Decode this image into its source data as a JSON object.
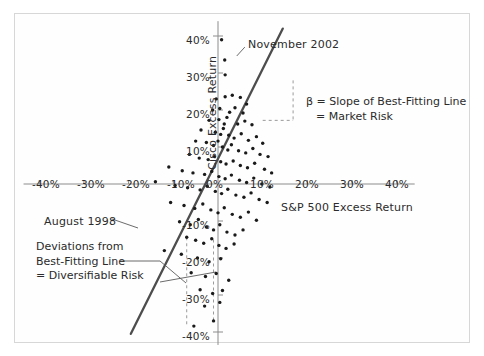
{
  "figure": {
    "background": "#ffffff",
    "frame_color": "#d7d7d7",
    "point_color": "#1a1a1a",
    "line_color": "#4d4d4d",
    "text_color": "#2b2b2b"
  },
  "chart_data": {
    "type": "scatter",
    "title": "",
    "xlabel": "S&P 500 Excess Return",
    "ylabel": "Cisco Excess Return",
    "xlim": [
      -45,
      45
    ],
    "ylim": [
      -45,
      45
    ],
    "grid": false,
    "legend": "none",
    "xticks": [
      "-40%",
      "-30%",
      "-20%",
      "-10%",
      "0%",
      "10%",
      "20%",
      "30%",
      "40%"
    ],
    "xtick_values": [
      -40,
      -30,
      -20,
      -10,
      0,
      10,
      20,
      30,
      40
    ],
    "yticks": [
      "40%",
      "30%",
      "20%",
      "10%",
      "0%",
      "-10%",
      "-20%",
      "-30%",
      "-40%"
    ],
    "ytick_values": [
      40,
      30,
      20,
      10,
      0,
      -10,
      -20,
      -30,
      -40
    ],
    "fit_line": {
      "x0": -19.5,
      "y0": -40.5,
      "x1": 14.5,
      "y1": 42.0,
      "label": "best-fitting-line"
    },
    "points": [
      [
        0.8,
        39.0
      ],
      [
        1.5,
        33.5
      ],
      [
        1.6,
        29.5
      ],
      [
        -0.4,
        23.0
      ],
      [
        1.6,
        23.6
      ],
      [
        3.2,
        24.0
      ],
      [
        5.0,
        23.4
      ],
      [
        6.4,
        21.6
      ],
      [
        -1.2,
        20.0
      ],
      [
        0.4,
        20.4
      ],
      [
        2.6,
        19.4
      ],
      [
        3.8,
        20.6
      ],
      [
        5.6,
        19.2
      ],
      [
        -2.0,
        17.2
      ],
      [
        0.2,
        17.4
      ],
      [
        1.4,
        16.2
      ],
      [
        2.0,
        18.0
      ],
      [
        4.4,
        16.2
      ],
      [
        6.0,
        17.0
      ],
      [
        7.6,
        16.0
      ],
      [
        -3.8,
        14.6
      ],
      [
        -0.6,
        14.0
      ],
      [
        0.6,
        13.4
      ],
      [
        1.2,
        15.0
      ],
      [
        2.4,
        13.2
      ],
      [
        3.6,
        12.4
      ],
      [
        5.2,
        13.6
      ],
      [
        6.8,
        11.8
      ],
      [
        8.6,
        12.8
      ],
      [
        10.0,
        11.0
      ],
      [
        -5.0,
        11.6
      ],
      [
        -2.6,
        11.2
      ],
      [
        -1.0,
        10.4
      ],
      [
        0.0,
        11.6
      ],
      [
        1.0,
        10.0
      ],
      [
        2.2,
        9.2
      ],
      [
        3.0,
        10.6
      ],
      [
        4.6,
        9.0
      ],
      [
        6.2,
        8.4
      ],
      [
        7.8,
        9.6
      ],
      [
        9.4,
        8.0
      ],
      [
        11.2,
        7.4
      ],
      [
        -6.4,
        8.0
      ],
      [
        -4.2,
        7.0
      ],
      [
        -2.2,
        6.6
      ],
      [
        -0.8,
        7.4
      ],
      [
        0.6,
        6.0
      ],
      [
        1.8,
        5.4
      ],
      [
        3.4,
        6.2
      ],
      [
        5.0,
        5.0
      ],
      [
        6.6,
        4.4
      ],
      [
        8.2,
        5.6
      ],
      [
        10.4,
        4.0
      ],
      [
        12.0,
        3.0
      ],
      [
        -11.0,
        4.6
      ],
      [
        -8.0,
        3.6
      ],
      [
        -5.6,
        3.0
      ],
      [
        -3.0,
        2.6
      ],
      [
        -1.4,
        3.4
      ],
      [
        0.2,
        2.0
      ],
      [
        1.6,
        1.4
      ],
      [
        3.0,
        2.4
      ],
      [
        4.8,
        1.0
      ],
      [
        6.4,
        0.4
      ],
      [
        8.0,
        1.6
      ],
      [
        9.8,
        0.0
      ],
      [
        11.6,
        -0.8
      ],
      [
        -14.0,
        0.6
      ],
      [
        -9.6,
        -0.4
      ],
      [
        -6.8,
        -1.0
      ],
      [
        -4.0,
        -1.6
      ],
      [
        -2.4,
        -0.6
      ],
      [
        -0.6,
        -2.0
      ],
      [
        0.8,
        -2.6
      ],
      [
        2.2,
        -1.4
      ],
      [
        4.0,
        -3.0
      ],
      [
        5.8,
        -3.6
      ],
      [
        7.4,
        -2.4
      ],
      [
        9.2,
        -4.2
      ],
      [
        11.0,
        -5.0
      ],
      [
        -10.6,
        -5.0
      ],
      [
        -7.6,
        -5.8
      ],
      [
        -5.2,
        -6.6
      ],
      [
        -3.4,
        -5.4
      ],
      [
        -1.6,
        -7.0
      ],
      [
        0.0,
        -7.8
      ],
      [
        1.4,
        -6.4
      ],
      [
        3.2,
        -8.2
      ],
      [
        5.0,
        -9.0
      ],
      [
        6.8,
        -7.6
      ],
      [
        8.6,
        -9.8
      ],
      [
        -8.6,
        -10.2
      ],
      [
        -6.2,
        -11.0
      ],
      [
        -4.4,
        -9.6
      ],
      [
        -2.6,
        -11.6
      ],
      [
        -1.0,
        -12.4
      ],
      [
        0.4,
        -11.0
      ],
      [
        2.0,
        -13.0
      ],
      [
        3.8,
        -13.8
      ],
      [
        5.6,
        -12.4
      ],
      [
        -7.0,
        -14.4
      ],
      [
        -5.0,
        -15.2
      ],
      [
        -3.2,
        -16.0
      ],
      [
        -1.4,
        -14.8
      ],
      [
        0.2,
        -16.6
      ],
      [
        1.8,
        -17.4
      ],
      [
        3.6,
        -16.2
      ],
      [
        -12.0,
        -18.0
      ],
      [
        -8.2,
        -19.0
      ],
      [
        -4.6,
        -20.0
      ],
      [
        -2.0,
        -21.0
      ],
      [
        0.6,
        -20.2
      ],
      [
        -6.0,
        -24.0
      ],
      [
        -2.8,
        -25.0
      ],
      [
        -0.4,
        -24.2
      ],
      [
        2.4,
        -26.0
      ],
      [
        -4.0,
        -28.6
      ],
      [
        -1.2,
        -29.6
      ],
      [
        1.0,
        -28.8
      ],
      [
        -3.0,
        -33.0
      ],
      [
        0.4,
        -32.0
      ],
      [
        -5.4,
        -38.4
      ],
      [
        -1.0,
        -37.0
      ]
    ],
    "annotations": [
      {
        "name": "november-2002",
        "text": "November 2002",
        "point": [
          0.8,
          39.0
        ]
      },
      {
        "name": "august-1998",
        "text": "August 1998",
        "point": [
          -7.0,
          -14.4
        ]
      },
      {
        "name": "beta-definition",
        "lines": [
          "β = Slope of Best-Fitting Line",
          "= Market Risk"
        ]
      },
      {
        "name": "diversifiable-risk",
        "lines": [
          "Deviations from",
          "Best-Fitting Line",
          "= Diversifiable Risk"
        ]
      }
    ]
  },
  "labels": {
    "xaxis": "S&P 500 Excess Return",
    "yaxis": "Cisco Excess Return",
    "november_2002": "November 2002",
    "august_1998": "August 1998",
    "beta_line1": "β = Slope of Best-Fitting Line",
    "beta_line2": "= Market Risk",
    "dev_line1": "Deviations from",
    "dev_line2": "Best-Fitting Line",
    "dev_line3": "= Diversifiable Risk",
    "x_t1": "-40%",
    "x_t2": "-30%",
    "x_t3": "-20%",
    "x_t4": "-10%",
    "x_t5": "0%",
    "x_t6": "10%",
    "x_t7": "20%",
    "x_t8": "30%",
    "x_t9": "40%",
    "y_t1": "40%",
    "y_t2": "30%",
    "y_t3": "20%",
    "y_t4": "10%",
    "y_t5": "0%",
    "y_t6": "-10%",
    "y_t7": "-20%",
    "y_t8": "-30%",
    "y_t9": "-40%"
  }
}
